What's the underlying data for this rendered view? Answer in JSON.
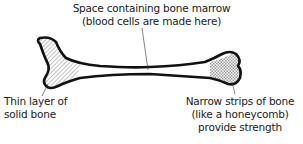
{
  "diagram": {
    "labels": {
      "marrow": {
        "line1": "Space containing bone marrow",
        "line2": "(blood cells are made here)"
      },
      "solid_bone": {
        "line1": "Thin layer of",
        "line2": "solid bone"
      },
      "spongy_bone": {
        "line1": "Narrow strips of bone",
        "line2": "(like a honeycomb)",
        "line3": "provide strength"
      }
    },
    "colors": {
      "outline": "#111111",
      "hatch": "#888888",
      "text": "#222222",
      "background": "#ffffff"
    }
  }
}
